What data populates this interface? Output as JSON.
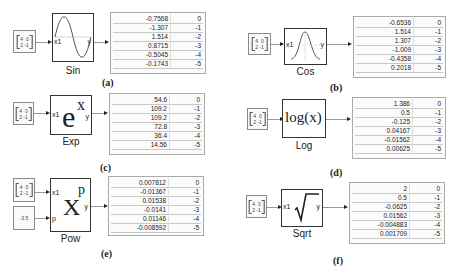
{
  "source": {
    "matrix_rows": [
      "4  0",
      "2 -1"
    ],
    "scalar": "-3.5"
  },
  "ports": {
    "input": "x1",
    "exponent_input": "p",
    "output": "y"
  },
  "panels": [
    {
      "id": "a",
      "caption": "(a)",
      "block_label": "Sin",
      "icon": "sine-wave",
      "values": [
        "-0.7568",
        "-1.307",
        "1.514",
        "0.8715",
        "-0.5045",
        "-0.1743"
      ],
      "exponents": [
        "0",
        "-1",
        "-2",
        "-3",
        "-4",
        "-5"
      ]
    },
    {
      "id": "b",
      "caption": "(b)",
      "block_label": "Cos",
      "icon": "cosine-bell",
      "values": [
        "-0.6536",
        "1.514",
        "1.307",
        "-1.009",
        "-0.4358",
        "0.2018"
      ],
      "exponents": [
        "0",
        "-1",
        "-2",
        "-3",
        "-4",
        "-5"
      ]
    },
    {
      "id": "c",
      "caption": "(c)",
      "block_label": "Exp",
      "icon": "exp",
      "icon_text": "e",
      "icon_sup": "x",
      "values": [
        "54.6",
        "109.2",
        "109.2",
        "72.8",
        "36.4",
        "14.56"
      ],
      "exponents": [
        "0",
        "-1",
        "-2",
        "-3",
        "-4",
        "-5"
      ]
    },
    {
      "id": "d",
      "caption": "(d)",
      "block_label": "Log",
      "icon": "log",
      "icon_text": "log(x)",
      "values": [
        "1.386",
        "0.5",
        "-0.125",
        "0.04167",
        "-0.01562",
        "0.00625"
      ],
      "exponents": [
        "0",
        "-1",
        "-2",
        "-3",
        "-4",
        "-5"
      ]
    },
    {
      "id": "e",
      "caption": "(e)",
      "block_label": "Pow",
      "icon": "pow",
      "icon_text": "X",
      "icon_sup": "p",
      "values": [
        "0.007812",
        "-0.01367",
        "0.01538",
        "-0.0141",
        "0.01146",
        "-0.008592"
      ],
      "exponents": [
        "0",
        "-1",
        "-2",
        "-3",
        "-4",
        "-5"
      ]
    },
    {
      "id": "f",
      "caption": "(f)",
      "block_label": "Sqrt",
      "icon": "sqrt",
      "icon_text": "√",
      "values": [
        "2",
        "0.5",
        "-0.0625",
        "0.01562",
        "-0.004883",
        "0.001709"
      ],
      "exponents": [
        "0",
        "-1",
        "-2",
        "-3",
        "-4",
        "-5"
      ]
    }
  ]
}
